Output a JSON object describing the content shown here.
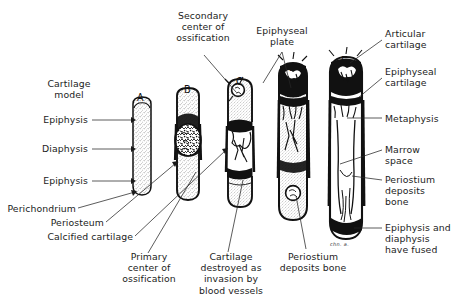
{
  "figure": {
    "background_color": "#ffffff",
    "ink_color": "#1a1a1a"
  },
  "stage_letters": [
    {
      "id": "A",
      "label": "A",
      "x": 137,
      "y": 92
    },
    {
      "id": "B",
      "label": "B",
      "x": 184,
      "y": 84
    },
    {
      "id": "C",
      "label": "C",
      "x": 236,
      "y": 76
    },
    {
      "id": "D",
      "label": "D",
      "x": 289,
      "y": 62
    },
    {
      "id": "E",
      "label": "E",
      "x": 341,
      "y": 55
    }
  ],
  "labels": {
    "cartilage_model": "Cartilage\nmodel",
    "epiphysis_top": "Epiphysis",
    "diaphysis": "Diaphysis",
    "epiphysis_bottom": "Epiphysis",
    "perichondrium": "Perichondrium",
    "periosteum": "Periosteum",
    "calcified_cartilage": "Calcified cartilage",
    "secondary_center": "Secondary\ncenter of\nossification",
    "epiphyseal_plate": "Epiphyseal\nplate",
    "articular_cartilage": "Articular\ncartilage",
    "epiphyseal_cartilage": "Epiphyseal\ncartilage",
    "metaphysis": "Metaphysis",
    "marrow_space": "Marrow\nspace",
    "periostium_deposits_bone_right": "Periostium\ndeposits\nbone",
    "epiphysis_diaphysis_fused": "Epiphysis and\ndiaphysis\nhave fused",
    "primary_center": "Primary\ncenter of\nossification",
    "cartilage_destroyed": "Cartilage\ndestroyed as\ninvasion by\nblood vessels",
    "periostium_deposits_bone_bottom": "Periostium\ndeposits bone"
  },
  "artist_signature": "chn. a."
}
